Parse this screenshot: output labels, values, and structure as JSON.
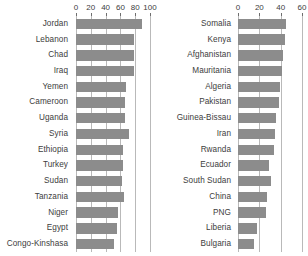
{
  "chart_data": [
    {
      "panel": "left",
      "type": "bar",
      "orientation": "horizontal",
      "title": "",
      "xlabel": "",
      "ylabel": "",
      "xlim": [
        0,
        100
      ],
      "ticks": [
        0,
        20,
        40,
        60,
        80,
        100
      ],
      "grid": true,
      "grid_axis": "x",
      "bar_color": "#8c8c8c",
      "categories": [
        "Jordan",
        "Lebanon",
        "Chad",
        "Iraq",
        "Yemen",
        "Cameroon",
        "Uganda",
        "Syria",
        "Ethiopia",
        "Turkey",
        "Sudan",
        "Tanzania",
        "Niger",
        "Egypt",
        "Congo-Kinshasa"
      ],
      "values": [
        89,
        79,
        79,
        79,
        67,
        66,
        66,
        72,
        64,
        64,
        62,
        65,
        57,
        56,
        52
      ]
    },
    {
      "panel": "right",
      "type": "bar",
      "orientation": "horizontal",
      "title": "",
      "xlabel": "",
      "ylabel": "",
      "xlim": [
        0,
        60
      ],
      "ticks": [
        0,
        20,
        40,
        60
      ],
      "grid": true,
      "grid_axis": "x",
      "bar_color": "#8c8c8c",
      "categories": [
        "Somalia",
        "Kenya",
        "Afghanistan",
        "Mauritania",
        "Algeria",
        "Pakistan",
        "Guinea-Bissau",
        "Iran",
        "Rwanda",
        "Ecuador",
        "South Sudan",
        "China",
        "PNG",
        "Liberia",
        "Bulgaria"
      ],
      "values": [
        45,
        44,
        42,
        41,
        39,
        38,
        36,
        35,
        34,
        29,
        31,
        27,
        26,
        18,
        15
      ]
    }
  ]
}
